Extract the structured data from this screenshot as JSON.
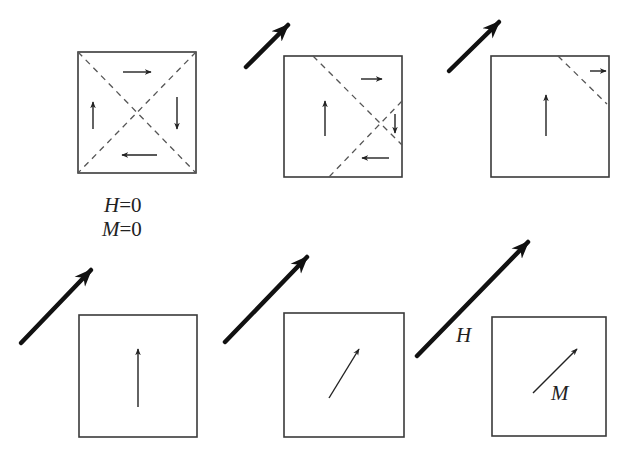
{
  "colors": {
    "background": "#ffffff",
    "box_stroke": "#3a3a3a",
    "dash_stroke": "#555555",
    "arrow_thin": "#222222",
    "arrow_field": "#111111",
    "text": "#222222"
  },
  "labels": {
    "h_zero_var": "H",
    "h_zero_eq": "=0",
    "m_zero_var": "M",
    "m_zero_eq": "=0",
    "field_label": "H",
    "magnetization_label": "M"
  },
  "panels": [
    {
      "id": "panel-1",
      "state": "demagnetized",
      "box": [
        78,
        52,
        196,
        173
      ],
      "field_arrow": null,
      "dashes": [
        [
          78,
          52,
          196,
          173
        ],
        [
          196,
          52,
          78,
          173
        ]
      ],
      "domain_arrows": [
        {
          "dir": "right",
          "from": [
            123,
            72
          ],
          "to": [
            151,
            72
          ]
        },
        {
          "dir": "down",
          "from": [
            177,
            97
          ],
          "to": [
            177,
            129
          ]
        },
        {
          "dir": "left",
          "from": [
            157,
            155
          ],
          "to": [
            122,
            155
          ]
        },
        {
          "dir": "up",
          "from": [
            93,
            129
          ],
          "to": [
            93,
            102
          ]
        }
      ]
    },
    {
      "id": "panel-2",
      "state": "domain-wall-motion-small",
      "box": [
        284,
        56,
        402,
        177
      ],
      "field_arrow": {
        "from": [
          246,
          67
        ],
        "to": [
          288,
          25
        ]
      },
      "dashes": [
        [
          313,
          56,
          402,
          145
        ],
        [
          402,
          101,
          329,
          177
        ]
      ],
      "domain_arrows": [
        {
          "dir": "right",
          "from": [
            361,
            79
          ],
          "to": [
            382,
            79
          ]
        },
        {
          "dir": "down",
          "from": [
            395,
            114
          ],
          "to": [
            395,
            133
          ]
        },
        {
          "dir": "left",
          "from": [
            389,
            158
          ],
          "to": [
            362,
            158
          ]
        },
        {
          "dir": "up",
          "from": [
            325,
            136
          ],
          "to": [
            325,
            101
          ]
        }
      ]
    },
    {
      "id": "panel-3",
      "state": "domain-wall-motion-large",
      "box": [
        491,
        56,
        609,
        177
      ],
      "field_arrow": {
        "from": [
          449,
          71
        ],
        "to": [
          499,
          22
        ]
      },
      "dashes": [
        [
          558,
          56,
          607,
          104
        ]
      ],
      "domain_arrows": [
        {
          "dir": "right",
          "from": [
            590,
            71
          ],
          "to": [
            606,
            71
          ]
        },
        {
          "dir": "up",
          "from": [
            546,
            136
          ],
          "to": [
            546,
            95
          ]
        }
      ]
    },
    {
      "id": "panel-4",
      "state": "single-domain",
      "box": [
        79,
        315,
        197,
        437
      ],
      "field_arrow": {
        "from": [
          21,
          343
        ],
        "to": [
          91,
          270
        ]
      },
      "dashes": [],
      "domain_arrows": [
        {
          "dir": "up",
          "from": [
            138,
            407
          ],
          "to": [
            138,
            349
          ]
        }
      ]
    },
    {
      "id": "panel-5",
      "state": "rotation",
      "box": [
        284,
        313,
        404,
        437
      ],
      "field_arrow": {
        "from": [
          225,
          342
        ],
        "to": [
          307,
          257
        ]
      },
      "dashes": [],
      "domain_arrows": [
        {
          "dir": "up-right",
          "from": [
            329,
            398
          ],
          "to": [
            359,
            349
          ]
        }
      ]
    },
    {
      "id": "panel-6",
      "state": "saturation",
      "box": [
        492,
        317,
        606,
        436
      ],
      "field_arrow": {
        "from": [
          417,
          356
        ],
        "to": [
          528,
          242
        ]
      },
      "dashes": [],
      "domain_arrows": [
        {
          "dir": "up-right",
          "from": [
            533,
            393
          ],
          "to": [
            577,
            349
          ]
        }
      ]
    }
  ]
}
